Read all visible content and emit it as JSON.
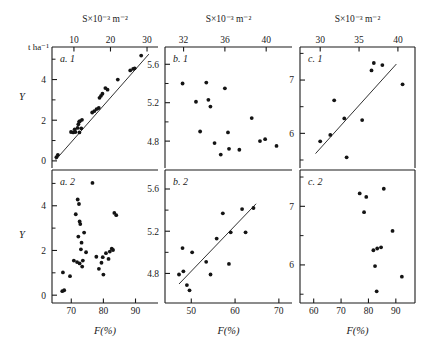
{
  "figure": {
    "y_axis_title": "Y",
    "y_unit_label": "t ha⁻¹",
    "top_axis_label": "S×10⁻³ m⁻²",
    "bottom_axis_label": "F(%)",
    "ink_color": "#1a1a1a",
    "background": "#ffffff"
  },
  "chart_data": [
    {
      "type": "scatter",
      "panel": "a. 1",
      "title": "",
      "xlabel": "S×10⁻³ m⁻²",
      "ylabel": "Y",
      "yunit": "t ha⁻¹",
      "xlim": [
        4,
        33
      ],
      "ylim": [
        -0.35,
        5.6
      ],
      "xticks": [
        10,
        20,
        30
      ],
      "yticks": [
        0,
        2,
        4
      ],
      "yticks_minor": [
        1,
        3,
        5
      ],
      "grid": false,
      "trendline": true,
      "trendline_points": [
        [
          5.0,
          0.05
        ],
        [
          30.5,
          5.25
        ]
      ],
      "x": [
        5.2,
        5.6,
        9.2,
        9.8,
        10.4,
        10.2,
        11.0,
        11.2,
        11.4,
        11.6,
        11.5,
        12.2,
        12.0,
        15.0,
        15.6,
        16.2,
        16.8,
        17.4,
        17.0,
        17.8,
        18.6,
        19.2,
        22.0,
        25.4,
        26.2,
        26.6,
        28.4
      ],
      "y": [
        0.18,
        0.3,
        1.42,
        1.4,
        1.42,
        1.55,
        1.62,
        1.8,
        1.92,
        1.95,
        1.4,
        2.02,
        1.6,
        2.38,
        2.45,
        2.55,
        2.6,
        3.2,
        3.1,
        3.3,
        3.58,
        3.5,
        4.0,
        4.45,
        4.52,
        4.55,
        5.18
      ]
    },
    {
      "type": "scatter",
      "panel": "b. 1",
      "xlabel": "S×10⁻³ m⁻²",
      "ylabel": "Y",
      "xlim": [
        30.2,
        42.5
      ],
      "ylim": [
        4.52,
        5.78
      ],
      "xticks": [
        32,
        36,
        40
      ],
      "yticks": [
        4.8,
        5.2,
        5.6
      ],
      "yticks_minor": [
        5.0,
        5.4
      ],
      "grid": false,
      "trendline": false,
      "x": [
        31.9,
        33.2,
        33.6,
        34.2,
        34.4,
        34.6,
        35.0,
        35.6,
        36.0,
        36.3,
        36.4,
        37.4,
        38.6,
        39.4,
        39.9,
        41.0
      ],
      "y": [
        5.4,
        5.21,
        4.9,
        5.41,
        5.23,
        5.16,
        4.78,
        4.66,
        5.35,
        4.89,
        4.72,
        4.71,
        5.04,
        4.8,
        4.82,
        4.75
      ]
    },
    {
      "type": "scatter",
      "panel": "c. 1",
      "xlabel": "S×10⁻³ m⁻²",
      "ylabel": "Y",
      "xlim": [
        27.4,
        42.2
      ],
      "ylim": [
        5.35,
        7.62
      ],
      "xticks": [
        30,
        35,
        40
      ],
      "yticks": [
        6,
        7
      ],
      "yticks_minor": [
        5.5,
        6.5,
        7.5
      ],
      "grid": false,
      "trendline": true,
      "trendline_points": [
        [
          29.4,
          5.62
        ],
        [
          39.8,
          7.3
        ]
      ],
      "x": [
        30.0,
        31.3,
        31.8,
        33.1,
        33.4,
        35.4,
        36.6,
        36.9,
        38.0,
        40.6
      ],
      "y": [
        5.85,
        5.97,
        6.62,
        6.28,
        5.55,
        6.25,
        7.18,
        7.32,
        7.28,
        6.92
      ]
    },
    {
      "type": "scatter",
      "panel": "a. 2",
      "xlabel": "F(%)",
      "ylabel": "Y",
      "yunit": "t ha⁻¹",
      "xlim": [
        64,
        97
      ],
      "ylim": [
        -0.35,
        5.6
      ],
      "xticks": [
        70,
        80,
        90
      ],
      "yticks": [
        0,
        2,
        4
      ],
      "yticks_minor": [
        1,
        3,
        5
      ],
      "grid": false,
      "trendline": false,
      "x": [
        67.2,
        67.8,
        67.4,
        69.6,
        70.8,
        71.4,
        71.8,
        72.0,
        72.2,
        72.4,
        72.6,
        72.8,
        72.6,
        73.0,
        73.2,
        73.4,
        73.6,
        74.0,
        74.6,
        76.6,
        77.8,
        78.6,
        79.4,
        79.8,
        80.0,
        80.8,
        81.6,
        82.0,
        82.6,
        83.0,
        83.4,
        84.0
      ],
      "y": [
        0.18,
        0.22,
        1.02,
        0.85,
        1.55,
        3.62,
        1.48,
        4.28,
        2.62,
        4.08,
        1.42,
        3.18,
        3.3,
        2.05,
        2.35,
        1.28,
        1.55,
        2.8,
        1.92,
        5.02,
        1.72,
        1.18,
        1.45,
        1.7,
        0.92,
        1.88,
        1.62,
        1.95,
        2.08,
        2.02,
        3.68,
        3.58
      ]
    },
    {
      "type": "scatter",
      "panel": "b. 2",
      "xlabel": "F(%)",
      "ylabel": "Y",
      "xlim": [
        44,
        73
      ],
      "ylim": [
        4.52,
        5.78
      ],
      "xticks": [
        50,
        60,
        70
      ],
      "yticks": [
        4.8,
        5.2,
        5.6
      ],
      "yticks_minor": [
        5.0,
        5.4
      ],
      "grid": false,
      "trendline": true,
      "trendline_points": [
        [
          47.2,
          4.7
        ],
        [
          64.8,
          5.46
        ]
      ],
      "x": [
        47.2,
        48.0,
        48.2,
        49.0,
        49.6,
        50.2,
        53.4,
        54.4,
        55.8,
        57.2,
        58.6,
        59.0,
        61.6,
        62.4,
        64.2
      ],
      "y": [
        4.79,
        5.04,
        4.82,
        4.69,
        4.64,
        5.0,
        4.91,
        4.79,
        5.13,
        5.37,
        4.89,
        5.19,
        5.41,
        5.19,
        5.42
      ]
    },
    {
      "type": "scatter",
      "panel": "c. 2",
      "xlabel": "F(%)",
      "ylabel": "Y",
      "xlim": [
        55,
        97
      ],
      "ylim": [
        5.35,
        7.62
      ],
      "xticks": [
        60,
        70,
        80,
        90
      ],
      "yticks": [
        6,
        7
      ],
      "yticks_minor": [
        5.5,
        6.5,
        7.5
      ],
      "grid": false,
      "trendline": false,
      "x": [
        76.8,
        78.4,
        79.2,
        81.8,
        82.4,
        83.0,
        83.2,
        84.6,
        85.6,
        88.8,
        92.2
      ],
      "y": [
        7.22,
        6.9,
        7.16,
        6.25,
        5.98,
        5.55,
        6.28,
        6.3,
        7.3,
        6.58,
        5.8
      ]
    }
  ]
}
